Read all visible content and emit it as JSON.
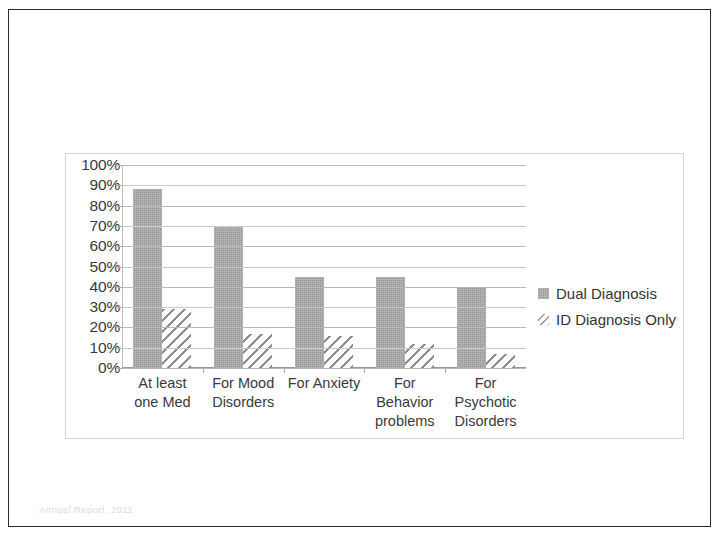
{
  "slide": {
    "footer_text": "Annual Report, 2011"
  },
  "legend": {
    "position": "right",
    "items": [
      {
        "label": "Dual Diagnosis",
        "swatch": "solid-gray-square-icon",
        "color": "#9a9a9a"
      },
      {
        "label": "ID Diagnosis Only",
        "swatch": "hatched-square-icon",
        "color": "#8f8f8f"
      }
    ]
  },
  "chart_data": {
    "type": "bar",
    "title": "",
    "subtitle": "",
    "xlabel": "",
    "ylabel": "",
    "ylim": [
      0,
      100
    ],
    "grid": true,
    "legend_position": "right",
    "categories": [
      "At least one Med",
      "For Mood Disorders",
      "For Anxiety",
      "For Behavior problems",
      "For Psychotic Disorders"
    ],
    "category_lines": [
      [
        "At least",
        "one Med"
      ],
      [
        "For Mood",
        "Disorders"
      ],
      [
        "For Anxiety"
      ],
      [
        "For",
        "Behavior",
        "problems"
      ],
      [
        "For",
        "Psychotic",
        "Disorders"
      ]
    ],
    "ytick_labels": [
      "100%",
      "90%",
      "80%",
      "70%",
      "60%",
      "50%",
      "40%",
      "30%",
      "20%",
      "10%",
      "0%"
    ],
    "ytick_values": [
      100,
      90,
      80,
      70,
      60,
      50,
      40,
      30,
      20,
      10,
      0
    ],
    "series": [
      {
        "name": "Dual Diagnosis",
        "color": "#9a9a9a",
        "fill": "solid",
        "values": [
          88,
          70,
          45,
          45,
          40
        ]
      },
      {
        "name": "ID Diagnosis Only",
        "color": "#8f8f8f",
        "fill": "diagonal-hatch",
        "values": [
          29,
          17,
          16,
          12,
          7
        ]
      }
    ]
  }
}
